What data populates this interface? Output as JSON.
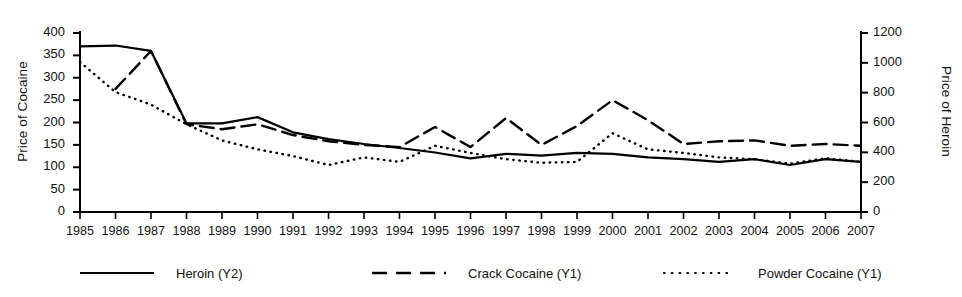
{
  "chart_data": {
    "type": "line",
    "title": "",
    "xlabel": "",
    "ylabel": "Price of Cocaine",
    "ylabel_secondary": "Price of Heroin",
    "grid": false,
    "legend_position": "bottom",
    "x": [
      "1985",
      "1986",
      "1987",
      "1988",
      "1989",
      "1990",
      "1991",
      "1992",
      "1993",
      "1994",
      "1995",
      "1996",
      "1997",
      "1998",
      "1999",
      "2000",
      "2001",
      "2002",
      "2003",
      "2004",
      "2005",
      "2006",
      "2007"
    ],
    "ylim": [
      0,
      400
    ],
    "yticks": [
      "0",
      "50",
      "100",
      "150",
      "200",
      "250",
      "300",
      "350",
      "400"
    ],
    "ylim_secondary": [
      0,
      1200
    ],
    "yticks_secondary": [
      "0",
      "200",
      "400",
      "600",
      "800",
      "1000",
      "1200"
    ],
    "series": [
      {
        "name": "Heroin (Y2)",
        "axis": "Y2",
        "style": "solid",
        "color": "#000000",
        "values": [
          370,
          372,
          360,
          198,
          198,
          212,
          178,
          163,
          152,
          143,
          133,
          120,
          130,
          126,
          132,
          130,
          122,
          118,
          112,
          118,
          105,
          118,
          112
        ]
      },
      {
        "name": "Crack Cocaine (Y1)",
        "axis": "Y1",
        "style": "dashed",
        "color": "#000000",
        "values": [
          null,
          275,
          360,
          196,
          185,
          196,
          172,
          158,
          150,
          145,
          190,
          145,
          210,
          150,
          192,
          250,
          205,
          152,
          158,
          160,
          148,
          152,
          148
        ]
      },
      {
        "name": "Powder Cocaine (Y1)",
        "axis": "Y1",
        "style": "dotted",
        "color": "#000000",
        "values": [
          335,
          268,
          240,
          196,
          160,
          140,
          125,
          105,
          122,
          112,
          148,
          132,
          118,
          110,
          112,
          176,
          140,
          132,
          122,
          118,
          108,
          120,
          112
        ]
      }
    ],
    "legend": [
      {
        "label": "Heroin (Y2)",
        "style": "solid"
      },
      {
        "label": "Crack Cocaine (Y1)",
        "style": "dashed"
      },
      {
        "label": "Powder Cocaine (Y1)",
        "style": "dotted"
      }
    ],
    "plot_area": {
      "x0": 80,
      "x1": 861,
      "y0": 33,
      "y1": 212
    }
  }
}
